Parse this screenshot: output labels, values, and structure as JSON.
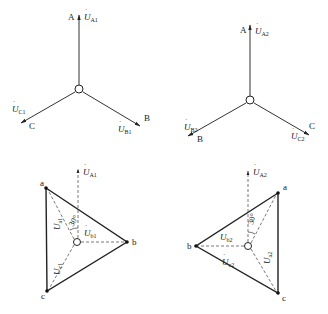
{
  "diagram": {
    "type": "phasor-diagram",
    "panels": [
      {
        "id": "star1",
        "kind": "star",
        "phases": {
          "A": {
            "label": "A",
            "vector": "U",
            "sub": "A1"
          },
          "B": {
            "label": "B",
            "vector": "U",
            "sub": "B1"
          },
          "C": {
            "label": "C",
            "vector": "U",
            "sub": "C1"
          }
        }
      },
      {
        "id": "star2",
        "kind": "star",
        "phases": {
          "A": {
            "label": "A",
            "vector": "U",
            "sub": "A2"
          },
          "B": {
            "label": "B",
            "vector": "U",
            "sub": "B2"
          },
          "C": {
            "label": "C",
            "vector": "U",
            "sub": "C2"
          }
        }
      },
      {
        "id": "delta1",
        "kind": "triangle",
        "ref": {
          "vector": "U",
          "sub": "A1"
        },
        "vertices": {
          "a": "a",
          "b": "b",
          "c": "c"
        },
        "vectors": [
          {
            "vector": "U",
            "sub": "a1"
          },
          {
            "vector": "U",
            "sub": "b1"
          },
          {
            "vector": "U",
            "sub": "c1"
          }
        ],
        "angle": "30°"
      },
      {
        "id": "delta2",
        "kind": "triangle",
        "ref": {
          "vector": "U",
          "sub": "A2"
        },
        "vertices": {
          "a": "a",
          "b": "b",
          "c": "c"
        },
        "vectors": [
          {
            "vector": "U",
            "sub": "a2"
          },
          {
            "vector": "U",
            "sub": "b2"
          },
          {
            "vector": "U",
            "sub": "c2"
          }
        ],
        "angle": "30°"
      }
    ]
  }
}
